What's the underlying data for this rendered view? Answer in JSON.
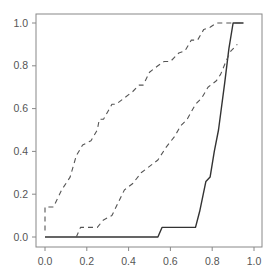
{
  "chart_data": {
    "type": "line",
    "title": "",
    "xlabel": "",
    "ylabel": "",
    "xlim": [
      0.0,
      1.0
    ],
    "ylim": [
      0.0,
      1.0
    ],
    "grid": false,
    "legend": null,
    "x_ticks": [
      "0.0",
      "0.2",
      "0.4",
      "0.6",
      "0.8",
      "1.0"
    ],
    "y_ticks": [
      "0.0",
      "0.2",
      "0.4",
      "0.6",
      "0.8",
      "1.0"
    ],
    "series": [
      {
        "name": "estimate",
        "style": "solid",
        "color": "#333333",
        "points": [
          [
            0.0,
            0.0
          ],
          [
            0.54,
            0.0
          ],
          [
            0.56,
            0.045
          ],
          [
            0.72,
            0.045
          ],
          [
            0.74,
            0.12
          ],
          [
            0.77,
            0.26
          ],
          [
            0.79,
            0.28
          ],
          [
            0.81,
            0.4
          ],
          [
            0.83,
            0.5
          ],
          [
            0.86,
            0.72
          ],
          [
            0.88,
            0.88
          ],
          [
            0.9,
            1.0
          ],
          [
            0.95,
            1.0
          ]
        ]
      },
      {
        "name": "upper-bound",
        "style": "dashed",
        "color": "#555555",
        "points": [
          [
            0.0,
            0.03
          ],
          [
            0.0,
            0.14
          ],
          [
            0.04,
            0.14
          ],
          [
            0.08,
            0.22
          ],
          [
            0.12,
            0.28
          ],
          [
            0.15,
            0.38
          ],
          [
            0.18,
            0.43
          ],
          [
            0.22,
            0.45
          ],
          [
            0.25,
            0.5
          ],
          [
            0.26,
            0.55
          ],
          [
            0.28,
            0.55
          ],
          [
            0.32,
            0.62
          ],
          [
            0.34,
            0.62
          ],
          [
            0.38,
            0.65
          ],
          [
            0.42,
            0.68
          ],
          [
            0.45,
            0.71
          ],
          [
            0.47,
            0.71
          ],
          [
            0.5,
            0.77
          ],
          [
            0.54,
            0.8
          ],
          [
            0.57,
            0.82
          ],
          [
            0.6,
            0.82
          ],
          [
            0.64,
            0.86
          ],
          [
            0.67,
            0.87
          ],
          [
            0.7,
            0.92
          ],
          [
            0.73,
            0.92
          ],
          [
            0.76,
            0.97
          ],
          [
            0.79,
            0.98
          ],
          [
            0.82,
            1.0
          ],
          [
            0.94,
            1.0
          ]
        ]
      },
      {
        "name": "lower-bound",
        "style": "dashed",
        "color": "#555555",
        "points": [
          [
            0.15,
            0.0
          ],
          [
            0.17,
            0.045
          ],
          [
            0.25,
            0.045
          ],
          [
            0.28,
            0.08
          ],
          [
            0.32,
            0.1
          ],
          [
            0.35,
            0.16
          ],
          [
            0.38,
            0.22
          ],
          [
            0.42,
            0.25
          ],
          [
            0.46,
            0.3
          ],
          [
            0.5,
            0.33
          ],
          [
            0.54,
            0.36
          ],
          [
            0.58,
            0.42
          ],
          [
            0.62,
            0.47
          ],
          [
            0.65,
            0.52
          ],
          [
            0.68,
            0.55
          ],
          [
            0.72,
            0.62
          ],
          [
            0.75,
            0.65
          ],
          [
            0.78,
            0.7
          ],
          [
            0.82,
            0.73
          ],
          [
            0.84,
            0.76
          ],
          [
            0.87,
            0.83
          ],
          [
            0.89,
            0.87
          ],
          [
            0.92,
            0.9
          ]
        ]
      }
    ]
  }
}
